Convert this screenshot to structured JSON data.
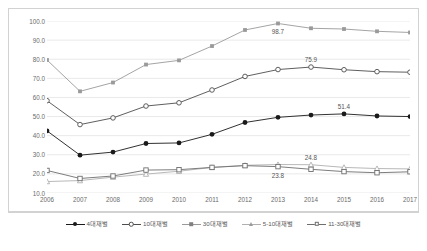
{
  "chart_data": {
    "type": "line",
    "title": "",
    "xlabel": "",
    "ylabel": "",
    "ylim": [
      10.0,
      100.0
    ],
    "ytick_step": 10.0,
    "grid": true,
    "legend_position": "bottom",
    "categories": [
      "2006",
      "2007",
      "2008",
      "2009",
      "2010",
      "2011",
      "2012",
      "2013",
      "2014",
      "2015",
      "2016",
      "2017"
    ],
    "ytick_labels": [
      "100.0",
      "90.0",
      "80.0",
      "70.0",
      "60.0",
      "50.0",
      "40.0",
      "30.0",
      "20.0",
      "10.0"
    ],
    "series": [
      {
        "name": "4대재벌",
        "marker": "filled-circle",
        "color": "#1a1a1a",
        "values": [
          42.5,
          29.8,
          31.4,
          35.9,
          36.2,
          40.7,
          46.9,
          49.6,
          50.8,
          51.4,
          50.3,
          50.0
        ]
      },
      {
        "name": "10대재벌",
        "marker": "open-circle",
        "color": "#4d4d4d",
        "values": [
          58.3,
          45.8,
          49.3,
          55.5,
          57.2,
          63.9,
          71.0,
          74.6,
          75.9,
          74.5,
          73.5,
          73.2
        ]
      },
      {
        "name": "30대재벌",
        "marker": "filled-square",
        "color": "#9a9a9a",
        "values": [
          79.6,
          63.2,
          67.8,
          77.2,
          79.4,
          86.9,
          95.3,
          98.7,
          96.2,
          95.8,
          94.6,
          94.0
        ]
      },
      {
        "name": "5-10대재벌",
        "marker": "open-triangle",
        "color": "#b0b0b0",
        "values": [
          16.0,
          16.5,
          18.3,
          19.9,
          21.4,
          23.4,
          24.5,
          24.9,
          24.8,
          23.4,
          22.8,
          22.6
        ]
      },
      {
        "name": "11-30대재벌",
        "marker": "open-square",
        "color": "#6e6e6e",
        "values": [
          21.8,
          17.6,
          18.9,
          22.0,
          22.2,
          23.4,
          24.3,
          23.8,
          22.4,
          21.2,
          20.6,
          21.1
        ]
      }
    ],
    "point_labels": [
      {
        "series": "30대재벌",
        "category": "2013",
        "value": 98.7,
        "text": "98.7",
        "position": "below"
      },
      {
        "series": "10대재벌",
        "category": "2014",
        "value": 75.9,
        "text": "75.9",
        "position": "above"
      },
      {
        "series": "4대재벌",
        "category": "2015",
        "value": 51.4,
        "text": "51.4",
        "position": "above"
      },
      {
        "series": "5-10대재벌",
        "category": "2014",
        "value": 24.8,
        "text": "24.8",
        "position": "above"
      },
      {
        "series": "11-30대재벌",
        "category": "2013",
        "value": 23.8,
        "text": "23.8",
        "position": "below"
      }
    ]
  },
  "legend": {
    "items": [
      {
        "label": "4대재벌",
        "marker": "filled-circle"
      },
      {
        "label": "10대재벌",
        "marker": "open-circle"
      },
      {
        "label": "30대재벌",
        "marker": "filled-square"
      },
      {
        "label": "5-10대재벌",
        "marker": "open-triangle"
      },
      {
        "label": "11-30대재벌",
        "marker": "open-square"
      }
    ]
  }
}
